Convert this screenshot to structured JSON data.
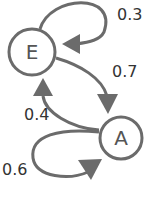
{
  "diagram": {
    "type": "markov-chain",
    "colors": {
      "stroke": "#6b6b6b",
      "text": "#333333",
      "background": "#ffffff"
    },
    "nodes": [
      {
        "id": "E",
        "label": "E"
      },
      {
        "id": "A",
        "label": "A"
      }
    ],
    "edges": [
      {
        "from": "E",
        "to": "E",
        "label": "0.3"
      },
      {
        "from": "E",
        "to": "A",
        "label": "0.7"
      },
      {
        "from": "A",
        "to": "E",
        "label": "0.4"
      },
      {
        "from": "A",
        "to": "A",
        "label": "0.6"
      }
    ]
  }
}
